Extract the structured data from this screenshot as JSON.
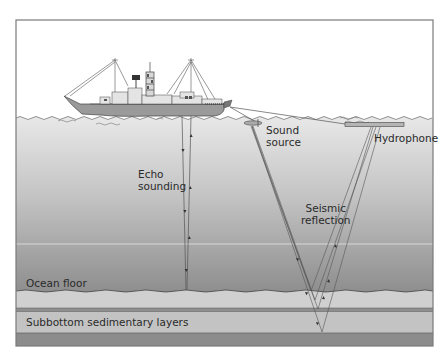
{
  "diagram": {
    "colors": {
      "sky": "#ffffff",
      "water_top": "#e6e6e6",
      "water_bottom": "#8f8f8f",
      "ocean_floor_band": "#cfcfcf",
      "sediment_line": "#8a8a8a",
      "sediment_band": "#c2c2c2",
      "bedrock_band": "#8c8c8c",
      "ship_hull": "#9a9a9a",
      "frame": "#7a7a7a"
    },
    "labels": {
      "echo_sounding": [
        "Echo",
        "sounding"
      ],
      "sound_source": [
        "Sound",
        "source"
      ],
      "hydrophone": "Hydrophone",
      "seismic_reflection": [
        "Seismic",
        "reflection"
      ],
      "ocean_floor": "Ocean floor",
      "subbottom": "Subbottom sedimentary layers"
    },
    "elements": [
      {
        "name": "ship",
        "icon": "ship-icon"
      },
      {
        "name": "sound-source",
        "icon": "towed-source-icon"
      },
      {
        "name": "hydrophone",
        "icon": "hydrophone-streamer-icon"
      },
      {
        "name": "echo-sounding-paths",
        "description": "vertical sound rays from ship hull to ocean floor and back"
      },
      {
        "name": "seismic-reflection-paths",
        "description": "V-shaped rays from sound source reflecting off subbottom layers up to hydrophone"
      }
    ]
  }
}
